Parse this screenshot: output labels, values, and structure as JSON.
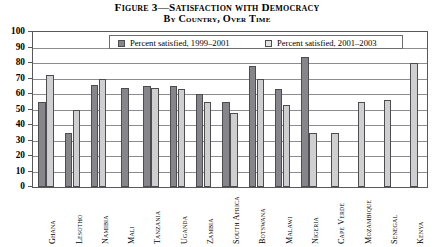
{
  "figure": {
    "title_line1": "Figure 3—Satisfaction with Democracy",
    "title_line2": "By Country, Over Time"
  },
  "legend": {
    "series1_label": "Percent satisfied, 1999–2001",
    "series2_label": "Percent satisfied, 2001–2003",
    "series1_color": "#85858a",
    "series2_color": "#cfcfd2"
  },
  "axis": {
    "y_ticks": [
      "100",
      "90",
      "80",
      "70",
      "60",
      "50",
      "40",
      "30",
      "20",
      "10",
      "0"
    ],
    "y_min": 0,
    "y_max": 100,
    "y_step": 10
  },
  "chart_data": {
    "type": "bar",
    "title": "Figure 3—Satisfaction with Democracy By Country, Over Time",
    "xlabel": "",
    "ylabel": "",
    "ylim": [
      0,
      100
    ],
    "ytick_step": 10,
    "grid": true,
    "legend_position": "top-inside",
    "categories": [
      "Ghana",
      "Lesotho",
      "Namibia",
      "Mali",
      "Tanzania",
      "Uganda",
      "Zambia",
      "South Africa",
      "Botswana",
      "Malawi",
      "Nigeria",
      "Cape Verde",
      "Mozambique",
      "Senegal",
      "Kenya"
    ],
    "series": [
      {
        "name": "Percent satisfied, 1999–2001",
        "values": [
          55,
          35,
          66,
          64,
          65,
          65,
          60,
          55,
          78,
          63,
          84,
          null,
          null,
          null,
          null
        ]
      },
      {
        "name": "Percent satisfied, 2001–2003",
        "values": [
          72,
          50,
          70,
          null,
          64,
          63,
          55,
          48,
          70,
          53,
          35,
          35,
          55,
          56,
          80
        ]
      }
    ]
  }
}
